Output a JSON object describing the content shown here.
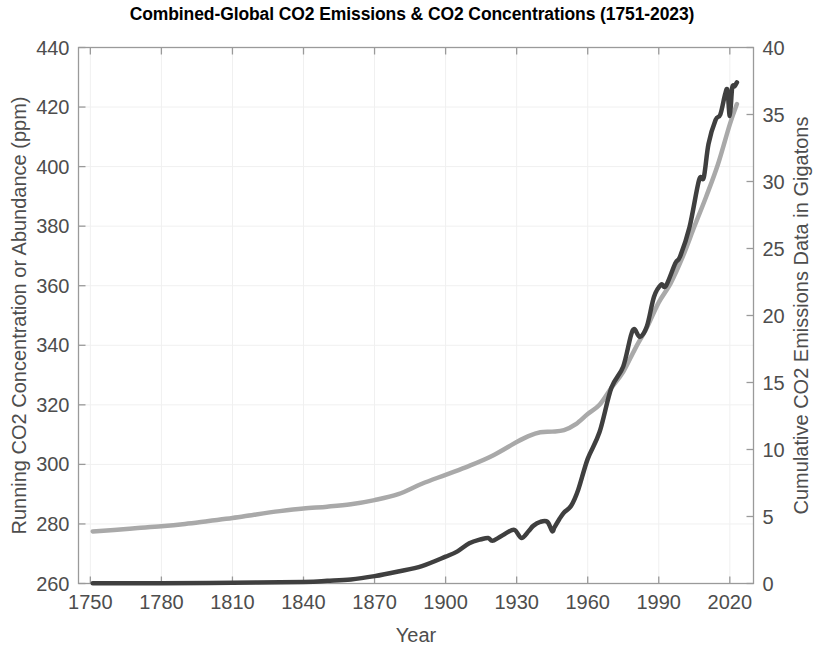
{
  "chart_data": {
    "type": "line",
    "title": "Combined-Global CO2 Emissions & CO2 Concentrations (1751-2023)",
    "xlabel": "Year",
    "ylabel": "Running CO2 Concentration or Abundance (ppm)",
    "ylabel_right": "Cumulative CO2 Emissions Data in Gigatons",
    "xlim": [
      1745,
      2030
    ],
    "ylim": [
      260,
      440
    ],
    "ylim_right": [
      0,
      40
    ],
    "xticks": [
      1750,
      1780,
      1810,
      1840,
      1870,
      1900,
      1930,
      1960,
      1990,
      2020
    ],
    "xticklabels": [
      "1750",
      "1780",
      "1810",
      "1840",
      "1870",
      "1900",
      "1930",
      "1960",
      "1990",
      "2020"
    ],
    "yticks": [
      260,
      280,
      300,
      320,
      340,
      360,
      380,
      400,
      420,
      440
    ],
    "yticklabels": [
      "260",
      "280",
      "300",
      "320",
      "340",
      "360",
      "380",
      "400",
      "420",
      "440"
    ],
    "yticks_right": [
      0,
      5,
      10,
      15,
      20,
      25,
      30,
      35,
      40
    ],
    "yticklabels_right": [
      "0",
      "5",
      "10",
      "15",
      "20",
      "25",
      "30",
      "35",
      "40"
    ],
    "grid": true,
    "legend": "none",
    "series": [
      {
        "name": "Running CO2 Concentration or Abundance (ppm)",
        "axis": "left",
        "color": "#a9a9a9",
        "linewidth": 4.5,
        "x": [
          1751,
          1760,
          1770,
          1780,
          1790,
          1800,
          1810,
          1820,
          1830,
          1840,
          1850,
          1860,
          1870,
          1880,
          1890,
          1900,
          1910,
          1920,
          1930,
          1935,
          1940,
          1945,
          1950,
          1955,
          1960,
          1965,
          1970,
          1975,
          1980,
          1985,
          1990,
          1995,
          2000,
          2005,
          2010,
          2015,
          2020,
          2023
        ],
        "y": [
          277.5,
          278.0,
          278.6,
          279.2,
          280.0,
          281.0,
          282.0,
          283.2,
          284.3,
          285.2,
          285.8,
          286.6,
          288.0,
          290.0,
          293.5,
          296.5,
          299.5,
          303.0,
          307.5,
          309.5,
          310.8,
          311.0,
          311.5,
          313.5,
          316.9,
          320.0,
          325.7,
          331.1,
          338.8,
          346.0,
          354.4,
          360.8,
          369.5,
          379.8,
          389.9,
          400.8,
          414.2,
          421.0
        ]
      },
      {
        "name": "Cumulative CO2 Emissions Data in Gigatons",
        "axis": "right",
        "color": "#3f3f3f",
        "linewidth": 4.5,
        "x": [
          1751,
          1780,
          1810,
          1840,
          1850,
          1860,
          1870,
          1880,
          1890,
          1900,
          1905,
          1910,
          1915,
          1918,
          1920,
          1925,
          1929,
          1932,
          1935,
          1937,
          1940,
          1943,
          1945,
          1946,
          1948,
          1950,
          1953,
          1956,
          1960,
          1965,
          1970,
          1975,
          1979,
          1982,
          1985,
          1988,
          1991,
          1993,
          1997,
          1999,
          2003,
          2007,
          2009,
          2011,
          2014,
          2016,
          2018,
          2019,
          2020,
          2021,
          2022,
          2023
        ],
        "y": [
          0.01,
          0.02,
          0.05,
          0.12,
          0.2,
          0.3,
          0.55,
          0.9,
          1.3,
          2.0,
          2.4,
          3.0,
          3.3,
          3.4,
          3.2,
          3.7,
          4.0,
          3.4,
          3.9,
          4.3,
          4.6,
          4.6,
          3.9,
          4.2,
          4.8,
          5.3,
          5.8,
          7.0,
          9.3,
          11.3,
          14.6,
          16.2,
          18.9,
          18.4,
          19.2,
          21.4,
          22.3,
          22.2,
          23.9,
          24.4,
          26.6,
          30.1,
          30.3,
          32.8,
          34.6,
          35.0,
          36.5,
          36.8,
          34.9,
          37.0,
          37.1,
          37.4
        ]
      }
    ]
  },
  "axis": {
    "x_title": "Year",
    "y_left_title": "Running CO2 Concentration or Abundance (ppm)",
    "y_right_title": "Cumulative CO2 Emissions Data in Gigatons"
  }
}
